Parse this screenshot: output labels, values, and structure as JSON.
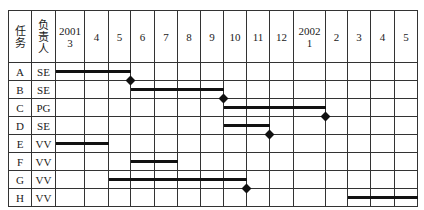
{
  "headers": {
    "task": "任务",
    "owner": "负责人",
    "months": [
      "2001\n3",
      "4",
      "5",
      "6",
      "7",
      "8",
      "9",
      "10",
      "11",
      "12",
      "2002\n1",
      "2",
      "3",
      "4",
      "5"
    ]
  },
  "rows": [
    {
      "task": "A",
      "owner": "SE"
    },
    {
      "task": "B",
      "owner": "SE"
    },
    {
      "task": "C",
      "owner": "PG"
    },
    {
      "task": "D",
      "owner": "SE"
    },
    {
      "task": "E",
      "owner": "VV"
    },
    {
      "task": "F",
      "owner": "VV"
    },
    {
      "task": "G",
      "owner": "VV"
    },
    {
      "task": "H",
      "owner": "VV"
    }
  ],
  "chart_data": {
    "type": "gantt",
    "title": "",
    "columns": [
      "任务",
      "负责人"
    ],
    "time_axis": [
      "2001-03",
      "2001-04",
      "2001-05",
      "2001-06",
      "2001-07",
      "2001-08",
      "2001-09",
      "2001-10",
      "2001-11",
      "2001-12",
      "2002-01",
      "2002-02",
      "2002-03",
      "2002-04",
      "2002-05"
    ],
    "tasks": [
      {
        "task": "A",
        "owner": "SE",
        "start_col": 0,
        "end_col": 3,
        "milestone": true
      },
      {
        "task": "B",
        "owner": "SE",
        "start_col": 3,
        "end_col": 7,
        "milestone": true
      },
      {
        "task": "C",
        "owner": "PG",
        "start_col": 7,
        "end_col": 11,
        "milestone": true
      },
      {
        "task": "D",
        "owner": "SE",
        "start_col": 7,
        "end_col": 9,
        "milestone": true
      },
      {
        "task": "E",
        "owner": "VV",
        "start_col": 0,
        "end_col": 2,
        "milestone": false
      },
      {
        "task": "F",
        "owner": "VV",
        "start_col": 3,
        "end_col": 5,
        "milestone": false
      },
      {
        "task": "G",
        "owner": "VV",
        "start_col": 2,
        "end_col": 8,
        "milestone": true
      },
      {
        "task": "H",
        "owner": "VV",
        "start_col": 12,
        "end_col": 15,
        "milestone": false
      }
    ]
  }
}
